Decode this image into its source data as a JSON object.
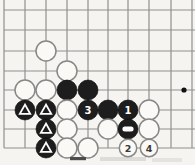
{
  "diagram": {
    "kind": "go-board-corner-diagram",
    "colors": {
      "background": "#f5f4f0",
      "grid_line": "#8f8f8f",
      "black_stone": "#1d1d1d",
      "black_stone_edge": "#000000",
      "white_stone": "#faf9f6",
      "white_stone_edge": "#878787",
      "mark": "#ffffff",
      "black_stone_label": "#ffffff",
      "white_stone_label": "#3a3a3a",
      "star_point": "#111111",
      "caption_ink": "#4c4c4c"
    },
    "grid": {
      "col_x": [
        4,
        25,
        46,
        67,
        88,
        108,
        128,
        149,
        171,
        192
      ],
      "row_y": [
        10,
        30,
        51,
        71,
        90,
        110,
        129,
        148
      ],
      "left_edge_x": 4,
      "top_extent_y": 0,
      "bottom_edge_y": 148,
      "right_extent_x": 195,
      "line_width": 1.2
    },
    "star_point": {
      "x": 184,
      "y": 90,
      "r": 2.6
    },
    "stone_radius": 10,
    "numbered_white_stone_radius": 8.7,
    "stones": [
      {
        "col": 2,
        "row": 2,
        "color": "white"
      },
      {
        "col": 3,
        "row": 3,
        "color": "white"
      },
      {
        "col": 1,
        "row": 4,
        "color": "white"
      },
      {
        "col": 2,
        "row": 4,
        "color": "white"
      },
      {
        "col": 3,
        "row": 4,
        "color": "black"
      },
      {
        "col": 4,
        "row": 4,
        "color": "black"
      },
      {
        "col": 1,
        "row": 5,
        "color": "black",
        "mark": "triangle"
      },
      {
        "col": 2,
        "row": 5,
        "color": "black",
        "mark": "triangle"
      },
      {
        "col": 3,
        "row": 5,
        "color": "white"
      },
      {
        "col": 4,
        "row": 5,
        "color": "black",
        "label": "3"
      },
      {
        "col": 5,
        "row": 5,
        "color": "black"
      },
      {
        "col": 6,
        "row": 5,
        "color": "black",
        "label": "1"
      },
      {
        "col": 7,
        "row": 5,
        "color": "white"
      },
      {
        "col": 2,
        "row": 6,
        "color": "black",
        "mark": "triangle"
      },
      {
        "col": 3,
        "row": 6,
        "color": "white"
      },
      {
        "col": 5,
        "row": 6,
        "color": "white"
      },
      {
        "col": 6,
        "row": 6,
        "color": "black",
        "mark": "square"
      },
      {
        "col": 7,
        "row": 6,
        "color": "white"
      },
      {
        "col": 2,
        "row": 7,
        "color": "black",
        "mark": "triangle"
      },
      {
        "col": 3,
        "row": 7,
        "color": "white"
      },
      {
        "col": 4,
        "row": 7,
        "color": "white"
      },
      {
        "col": 6,
        "row": 7,
        "color": "white",
        "label": "2"
      },
      {
        "col": 7,
        "row": 7,
        "color": "white",
        "label": "4"
      }
    ],
    "caption_fragment": {
      "bar": {
        "x": 70,
        "y": 157,
        "width": 16,
        "height": 3.2
      },
      "smudges": [
        {
          "x": 100,
          "y": 157,
          "width": 46,
          "height": 4,
          "opacity": 0.14
        },
        {
          "x": 152,
          "y": 158,
          "width": 30,
          "height": 4,
          "opacity": 0.1
        }
      ]
    }
  }
}
